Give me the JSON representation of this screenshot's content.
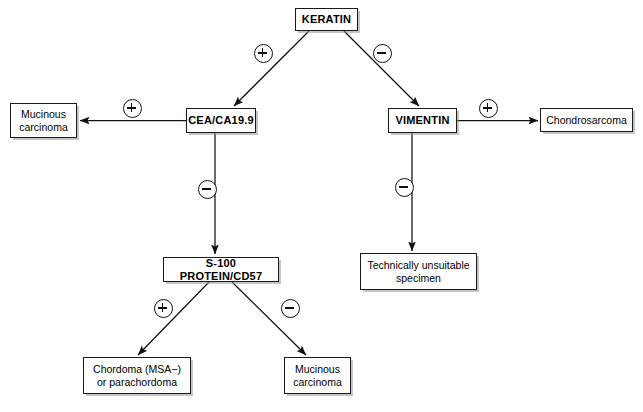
{
  "diagram": {
    "nodes": [
      {
        "id": "keratin",
        "label": "KERATIN",
        "style": "bold"
      },
      {
        "id": "cea",
        "label": "CEA/CA19.9",
        "style": "bold"
      },
      {
        "id": "vimentin",
        "label": "VIMENTIN",
        "style": "bold"
      },
      {
        "id": "s100",
        "label": "S-100 PROTEIN/CD57",
        "style": "bold"
      },
      {
        "id": "mucinous_l",
        "line1": "Mucinous",
        "line2": "carcinoma",
        "style": "plain"
      },
      {
        "id": "chondro",
        "label": "Chondrosarcoma",
        "style": "plain"
      },
      {
        "id": "unsuitable",
        "line1": "Technically unsuitable",
        "line2": "specimen",
        "style": "plain"
      },
      {
        "id": "chordoma",
        "line1": "Chordoma (MSA−)",
        "line2": "or parachordoma",
        "style": "plain"
      },
      {
        "id": "mucinous_b",
        "line1": "Mucinous",
        "line2": "carcinoma",
        "style": "plain"
      }
    ],
    "edges": [
      {
        "from": "keratin",
        "to": "cea",
        "sign": "plus"
      },
      {
        "from": "keratin",
        "to": "vimentin",
        "sign": "minus"
      },
      {
        "from": "cea",
        "to": "mucinous_l",
        "sign": "plus"
      },
      {
        "from": "cea",
        "to": "s100",
        "sign": "minus"
      },
      {
        "from": "vimentin",
        "to": "chondro",
        "sign": "plus"
      },
      {
        "from": "vimentin",
        "to": "unsuitable",
        "sign": "minus"
      },
      {
        "from": "s100",
        "to": "chordoma",
        "sign": "plus"
      },
      {
        "from": "s100",
        "to": "mucinous_b",
        "sign": "minus"
      }
    ],
    "signs": {
      "plus_symbol": "⊕",
      "minus_symbol": "⊖"
    }
  }
}
